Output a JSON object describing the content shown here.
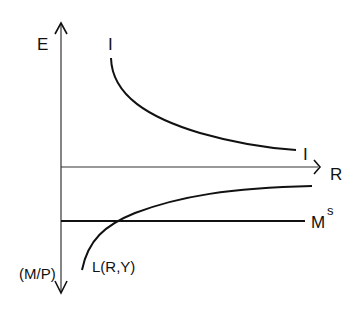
{
  "diagram": {
    "labels": {
      "y_axis_top": "E",
      "y_axis_bottom": "(M/P)",
      "x_axis": "R",
      "investment_start": "I",
      "investment_end": "I",
      "money_supply": "M",
      "money_supply_sup": "s",
      "money_demand": "L(R,Y)"
    },
    "colors": {
      "line": "#111111",
      "axis": "#333333",
      "background": "#ffffff"
    }
  }
}
